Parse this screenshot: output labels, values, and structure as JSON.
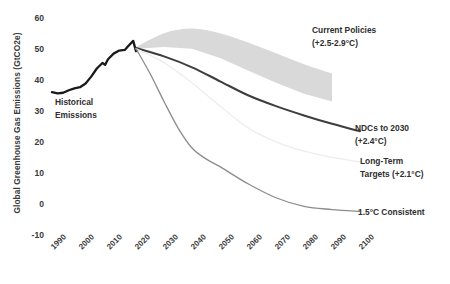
{
  "chart_data": {
    "type": "line",
    "title": "",
    "xlabel": "",
    "ylabel": "Global Greenhouse Gas Emissions (GtCO2e)",
    "xlim": [
      1990,
      2100
    ],
    "ylim": [
      -10,
      60
    ],
    "xticks": [
      "1990",
      "2000",
      "2010",
      "2020",
      "2030",
      "2040",
      "2050",
      "2060",
      "2070",
      "2080",
      "2090",
      "2100"
    ],
    "yticks": [
      "60",
      "50",
      "40",
      "30",
      "20",
      "10",
      "0",
      "-10"
    ],
    "grid": false,
    "legend_position": "inline-annotations",
    "series": [
      {
        "name": "Historical Emissions",
        "color": "#1a1a1a",
        "x": [
          1990,
          1992,
          1994,
          1996,
          1998,
          2000,
          2002,
          2004,
          2006,
          2008,
          2009,
          2010,
          2012,
          2014,
          2016,
          2017,
          2018,
          2019,
          2020,
          2021
        ],
        "values": [
          36.0,
          35.6,
          35.8,
          36.6,
          37.2,
          37.6,
          38.8,
          41.0,
          43.6,
          45.4,
          44.8,
          46.6,
          48.4,
          49.4,
          49.6,
          50.6,
          51.6,
          52.5,
          49.2,
          50.2
        ]
      },
      {
        "name": "Current Policies",
        "color": "#d9d9d9",
        "band": true,
        "x": [
          2020,
          2030,
          2040,
          2050,
          2060,
          2070,
          2080,
          2090
        ],
        "upper": [
          50.5,
          55.0,
          56.5,
          55.0,
          52.0,
          48.5,
          45.0,
          42.0
        ],
        "lower": [
          50.0,
          50.5,
          50.0,
          47.0,
          43.0,
          39.0,
          35.5,
          33.0
        ]
      },
      {
        "name": "NDCs to 2030",
        "color": "#3d3d3d",
        "x": [
          2020,
          2030,
          2040,
          2050,
          2060,
          2070,
          2080,
          2090,
          2100
        ],
        "values": [
          50.2,
          47.5,
          44.0,
          39.5,
          35.0,
          31.5,
          28.5,
          25.8,
          23.4
        ]
      },
      {
        "name": "Long-Term Targets",
        "color": "#ededed",
        "x": [
          2020,
          2030,
          2040,
          2050,
          2060,
          2070,
          2080,
          2090,
          2100
        ],
        "values": [
          50.0,
          45.5,
          39.0,
          31.5,
          24.5,
          20.0,
          17.0,
          15.0,
          13.5
        ]
      },
      {
        "name": "1.5C Consistent",
        "color": "#8c8c8c",
        "x": [
          2020,
          2025,
          2030,
          2035,
          2040,
          2045,
          2050,
          2060,
          2070,
          2080,
          2090,
          2100
        ],
        "values": [
          50.0,
          42.0,
          33.0,
          24.5,
          18.0,
          14.5,
          12.0,
          6.5,
          2.0,
          -0.8,
          -1.8,
          -2.4
        ]
      }
    ],
    "annotations": [
      {
        "id": "historical",
        "lines": [
          "Historical",
          "Emissions"
        ]
      },
      {
        "id": "current-policies",
        "lines": [
          "Current Policies",
          "(+2.5-2.9°C)"
        ]
      },
      {
        "id": "ndcs",
        "lines": [
          "NDCs to 2030",
          "(+2.4°C)"
        ]
      },
      {
        "id": "long-term",
        "lines": [
          "Long-Term",
          "Targets (+2.1°C)"
        ]
      },
      {
        "id": "consistent",
        "lines": [
          "1.5°C Consistent"
        ]
      }
    ]
  }
}
